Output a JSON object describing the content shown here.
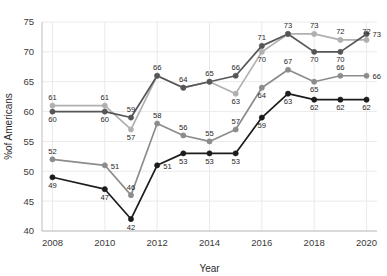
{
  "chart_data": {
    "type": "line",
    "title": "",
    "subtitle": "",
    "xlabel": "Year",
    "ylabel": "%of Americans",
    "x": [
      2008,
      2010,
      2011,
      2012,
      2013,
      2014,
      2015,
      2016,
      2017,
      2018,
      2019,
      2020
    ],
    "xlim": [
      2007.6,
      2020.4
    ],
    "ylim": [
      40,
      75
    ],
    "xticks": [
      2008,
      2010,
      2012,
      2014,
      2016,
      2018,
      2020
    ],
    "xticklabels": [
      "2008",
      "2010",
      "2012",
      "2014",
      "2016",
      "2018",
      "2020"
    ],
    "yticks": [
      40,
      45,
      50,
      55,
      60,
      65,
      70,
      75
    ],
    "yticklabels": [
      "40",
      "45",
      "50",
      "55",
      "60",
      "65",
      "70",
      "75"
    ],
    "grid": true,
    "legend": "none",
    "series": [
      {
        "name": "series-light-gray",
        "color": "#b0b0b0",
        "marker": "circle",
        "values": [
          61,
          61,
          57,
          66,
          64,
          65,
          63,
          70,
          73,
          73,
          72,
          72
        ],
        "labels": [
          "61",
          "61",
          "57",
          "66",
          "64",
          "65",
          "63",
          "70",
          "73",
          "73",
          "72",
          "72"
        ],
        "label_pos": [
          "above",
          "above",
          "below",
          "above",
          "above",
          "above",
          "below",
          "below",
          "above",
          "above",
          "above",
          "above"
        ]
      },
      {
        "name": "series-dark-gray-upper",
        "color": "#565656",
        "marker": "circle",
        "values": [
          60,
          60,
          59,
          66,
          64,
          65,
          66,
          71,
          73,
          70,
          70,
          73
        ],
        "labels": [
          "60",
          "60",
          "59",
          "66",
          "64",
          "65",
          "66",
          "71",
          "70",
          "70",
          "70",
          "73"
        ],
        "label_pos": [
          "below",
          "below",
          "above",
          "hidden",
          "hidden",
          "hidden",
          "above",
          "above",
          "hidden",
          "below",
          "below",
          "right"
        ]
      },
      {
        "name": "series-medium-gray",
        "color": "#8c8c8c",
        "marker": "circle",
        "values": [
          52,
          51,
          46,
          58,
          56,
          55,
          57,
          64,
          67,
          65,
          66,
          66
        ],
        "labels": [
          "52",
          "51",
          "46",
          "58",
          "56",
          "55",
          "57",
          "64",
          "67",
          "65",
          "66",
          "66"
        ],
        "label_pos": [
          "above",
          "right",
          "above",
          "above",
          "above",
          "above",
          "above",
          "below",
          "above",
          "below",
          "above",
          "right"
        ]
      },
      {
        "name": "series-black",
        "color": "#1c1c1c",
        "marker": "circle",
        "values": [
          49,
          47,
          42,
          51,
          53,
          53,
          53,
          59,
          63,
          62,
          62,
          62
        ],
        "labels": [
          "49",
          "47",
          "42",
          "51",
          "53",
          "53",
          "53",
          "59",
          "63",
          "62",
          "62",
          "62"
        ],
        "label_pos": [
          "below",
          "below",
          "below",
          "right",
          "below",
          "below",
          "below",
          "below",
          "below",
          "below",
          "below",
          "below"
        ]
      }
    ]
  },
  "axis": {
    "x_title": "Year",
    "y_title": "%of Americans"
  }
}
